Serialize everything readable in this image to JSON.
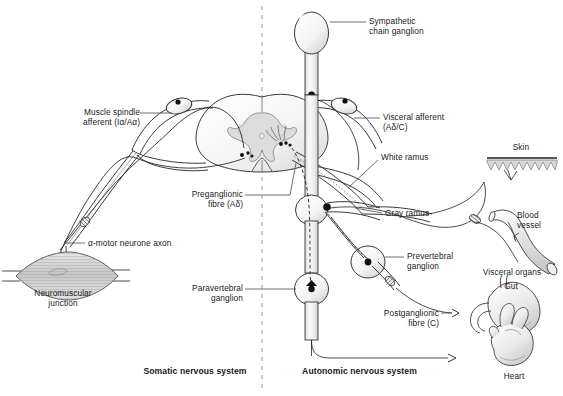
{
  "figure": {
    "type": "diagram",
    "divider": "dashed vertical line separating somatic (left) from autonomic (right)"
  },
  "sections": {
    "left_title": "Somatic nervous system",
    "right_title": "Autonomic nervous system"
  },
  "labels": {
    "muscle_spindle_afferent": "Muscle spindle\nafferent (Iα/Aα)",
    "alpha_motor_neurone_axon": "α-motor neurone axon",
    "neuromuscular_junction": "Neuromuscular\njunction",
    "preganglionic_fibre": "Preganglionic\nfibre (Aδ)",
    "paravertebral_ganglion": "Paravertebral\nganglion",
    "sympathetic_chain_ganglion": "Sympathetic\nchain ganglion",
    "visceral_afferent": "Visceral afferent\n(Aδ/C)",
    "white_ramus": "White ramus",
    "gray_ramus": "Gray ramus",
    "prevertebral_ganglion": "Prevertebral\nganglion",
    "postganglionic_fibre": "Postganglionic\nfibre (C)",
    "skin": "Skin",
    "blood_vessel": "Blood\nvessel",
    "visceral_organs": "Visceral organs",
    "gut": "Gut",
    "heart": "Heart"
  },
  "colors": {
    "background": "#ffffff",
    "ink": "#1a1a1a",
    "stroke": "#2b2b2b",
    "tissue_fill": "#f2f2f2",
    "gray_matter_fill": "#dddddd",
    "muscle_fill": "#cfcfcf",
    "divider": "#9a9a9a",
    "leader": "#4a4a4a"
  }
}
